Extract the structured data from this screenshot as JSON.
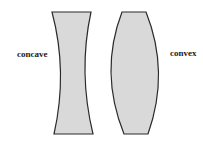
{
  "diagram": {
    "labels": {
      "concave": "concave",
      "convex": "convex"
    },
    "colors": {
      "lens_fill": "#d9d9d9",
      "lens_stroke": "#2a2a2a",
      "background": "#ffffff"
    },
    "shapes": [
      {
        "name": "concave-lens",
        "type": "biconcave lens"
      },
      {
        "name": "convex-lens",
        "type": "biconvex lens"
      }
    ]
  }
}
